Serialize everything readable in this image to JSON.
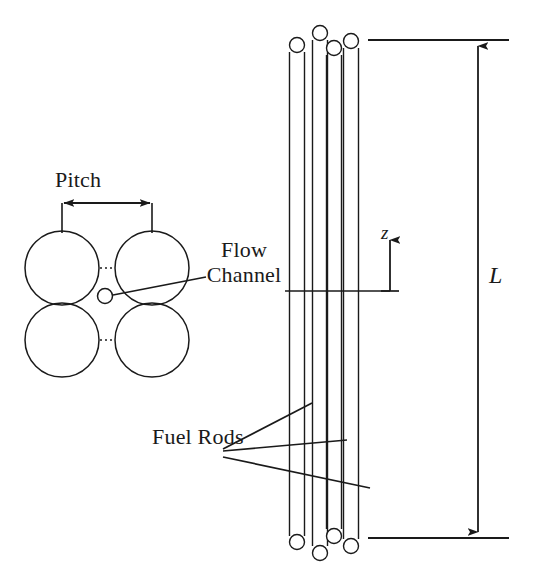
{
  "figure": {
    "background_color": "#ffffff",
    "line_color": "#1a1a1a",
    "width": 536,
    "height": 571
  },
  "labels": {
    "pitch": "Pitch",
    "flow_channel_line1": "Flow",
    "flow_channel_line2": "Channel",
    "fuel_rods": "Fuel Rods",
    "axial_coordinate": "z",
    "length": "L"
  },
  "cross_section": {
    "description": "Four fuel rod circles in a square array with dotted gap lines and a small flow-channel marker circle",
    "rod_radius": 37,
    "rod_centers": [
      {
        "cx": 62,
        "cy": 268
      },
      {
        "cx": 152,
        "cy": 268
      },
      {
        "cx": 62,
        "cy": 340
      },
      {
        "cx": 152,
        "cy": 340
      }
    ],
    "gap_marker": {
      "cx": 105,
      "cy": 296,
      "r": 7
    },
    "pitch_dimension": {
      "y": 203,
      "x_start": 62,
      "x_end": 152,
      "extension_bottom": 232,
      "arrowheads": "both"
    },
    "dotted_connectors": [
      {
        "x1": 99,
        "y1": 268,
        "x2": 115,
        "y2": 268
      },
      {
        "x1": 99,
        "y1": 340,
        "x2": 115,
        "y2": 340
      },
      {
        "x1": 62,
        "y1": 305,
        "x2": 62,
        "y2": 303
      },
      {
        "x1": 152,
        "y1": 305,
        "x2": 152,
        "y2": 303
      }
    ]
  },
  "axial_view": {
    "description": "Four vertical fuel rods with rounded end caps seen from the side",
    "rods": [
      {
        "id": "rod-1",
        "x_center": 297,
        "width": 15,
        "top": 45,
        "bottom": 542
      },
      {
        "id": "rod-2",
        "x_center": 320,
        "width": 15,
        "top": 33,
        "bottom": 553
      },
      {
        "id": "rod-3",
        "x_center": 334,
        "width": 15,
        "top": 48,
        "bottom": 536
      },
      {
        "id": "rod-4",
        "x_center": 351,
        "width": 15,
        "top": 41,
        "bottom": 546
      }
    ],
    "flow_channel_leader": {
      "y": 291,
      "x_start": 296,
      "x_end": 390
    },
    "flow_channel_callout": {
      "x1": 114,
      "y1": 295,
      "x2": 205,
      "y2": 278
    },
    "fuel_rod_leaders": [
      {
        "x1": 222,
        "y1": 449,
        "x2": 311,
        "y2": 404
      },
      {
        "x1": 222,
        "y1": 451,
        "x2": 345,
        "y2": 440
      },
      {
        "x1": 222,
        "y1": 456,
        "x2": 367,
        "y2": 487
      }
    ],
    "z_axis": {
      "x": 390,
      "y_base": 291,
      "y_tip": 233,
      "tick_half_width": 9
    }
  },
  "length_dimension": {
    "label": "L",
    "x": 478,
    "y_top": 40,
    "y_bottom": 538,
    "arrowheads": "both",
    "reference_line_top": {
      "x1": 368,
      "x2": 508,
      "y": 40
    },
    "reference_line_bottom": {
      "x1": 368,
      "x2": 508,
      "y": 538
    }
  }
}
